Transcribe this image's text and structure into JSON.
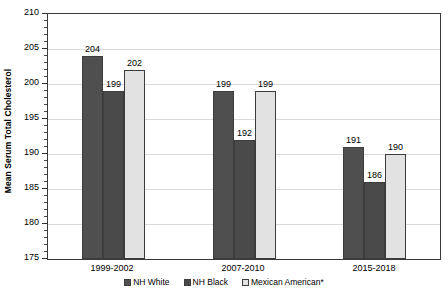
{
  "chart_data": {
    "type": "bar",
    "title": "",
    "subtitle": "",
    "xlabel": "",
    "ylabel": "Mean Serum Total Cholesterol",
    "ylim": [
      175,
      210
    ],
    "ytick_step": 5,
    "yminor_step": 1,
    "grid": true,
    "grid_axis": "y",
    "legend_position": "bottom",
    "categories": [
      "1999-2002",
      "2007-2010",
      "2015-2018"
    ],
    "ytick_labels": [
      "175",
      "180",
      "185",
      "190",
      "195",
      "200",
      "205",
      "210"
    ],
    "ytick_values": [
      175,
      180,
      185,
      190,
      195,
      200,
      205,
      210
    ],
    "series": [
      {
        "name": "NH White",
        "color": "#4f4f4f",
        "values": [
          204,
          199,
          191
        ],
        "labels": [
          "204",
          "199",
          "191"
        ]
      },
      {
        "name": "NH Black",
        "color": "#4a4a4a",
        "values": [
          199,
          192,
          186
        ],
        "labels": [
          "199",
          "192",
          "186"
        ]
      },
      {
        "name": "Mexican American*",
        "color": "#e2e2e2",
        "values": [
          202,
          199,
          190
        ],
        "labels": [
          "202",
          "199",
          "190"
        ]
      }
    ]
  },
  "axis": {
    "y_title": "Mean Serum Total Cholesterol"
  },
  "legend": {
    "items": [
      {
        "label": "NH White"
      },
      {
        "label": "NH Black"
      },
      {
        "label": "Mexican American*"
      }
    ]
  }
}
